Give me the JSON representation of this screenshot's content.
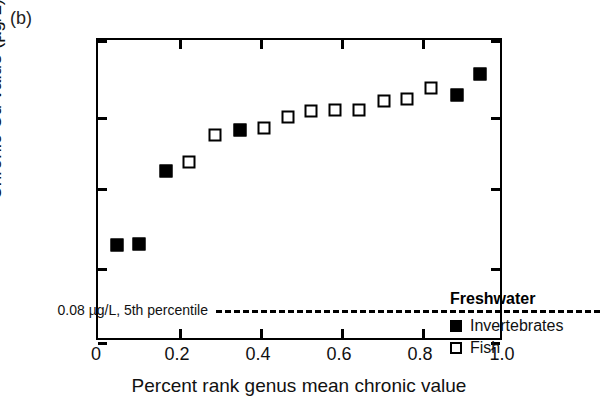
{
  "panel": {
    "label": "(b)"
  },
  "axes": {
    "y_title": "Chronic Cd value (µg/L)",
    "x_title": "Percent rank genus mean chronic value",
    "y_ticks": [
      {
        "label": "100",
        "px": 0
      },
      {
        "label": "10",
        "px": 77
      },
      {
        "label": "1",
        "px": 148
      },
      {
        "label": "−1",
        "px": 228
      },
      {
        "label": "−10",
        "px": 302
      }
    ],
    "x_ticks": [
      {
        "label": "0",
        "px": 0
      },
      {
        "label": "0.2",
        "px": 81
      },
      {
        "label": "0.4",
        "px": 162
      },
      {
        "label": "0.6",
        "px": 243
      },
      {
        "label": "0.8",
        "px": 324
      },
      {
        "label": "1.0",
        "px": 406
      }
    ]
  },
  "threshold": {
    "label": "0.08 µg/L, 5th percentile",
    "value": 0.08
  },
  "legend": {
    "title": "Freshwater",
    "items": [
      {
        "label": "Invertebrates",
        "marker": "filled-square"
      },
      {
        "label": "Fish",
        "marker": "open-square"
      }
    ]
  },
  "chart_data": {
    "type": "scatter",
    "title": "(b)",
    "xlabel": "Percent rank genus mean chronic value",
    "ylabel": "Chronic Cd value (µg/L)",
    "xlim": [
      0,
      1.0
    ],
    "ylim": [
      -10,
      100
    ],
    "yscale": "signed-log (broken axis: 100, 10, 1, -1, -10)",
    "grid": false,
    "legend_position": "inside-lower-right",
    "annotations": [
      {
        "type": "hline",
        "y": 0.08,
        "text": "0.08 µg/L, 5th percentile",
        "style": "dashed"
      }
    ],
    "series": [
      {
        "name": "Invertebrates",
        "marker": "filled-square",
        "points": [
          {
            "x": 0.05,
            "y": 0.6,
            "px": 19,
            "py": 205
          },
          {
            "x": 0.105,
            "y": 0.62,
            "px": 41,
            "py": 204
          },
          {
            "x": 0.17,
            "y": 1.8,
            "px": 68,
            "py": 131
          },
          {
            "x": 0.35,
            "y": 5.2,
            "px": 142,
            "py": 90
          },
          {
            "x": 0.88,
            "y": 21.0,
            "px": 359,
            "py": 55
          },
          {
            "x": 0.955,
            "y": 36.0,
            "px": 382,
            "py": 34
          }
        ]
      },
      {
        "name": "Fish",
        "marker": "open-square",
        "points": [
          {
            "x": 0.225,
            "y": 2.3,
            "px": 91,
            "py": 122
          },
          {
            "x": 0.29,
            "y": 4.7,
            "px": 117,
            "py": 95
          },
          {
            "x": 0.41,
            "y": 5.5,
            "px": 166,
            "py": 88
          },
          {
            "x": 0.47,
            "y": 7.4,
            "px": 190,
            "py": 77
          },
          {
            "x": 0.525,
            "y": 8.6,
            "px": 213,
            "py": 71
          },
          {
            "x": 0.585,
            "y": 8.8,
            "px": 237,
            "py": 70
          },
          {
            "x": 0.645,
            "y": 8.8,
            "px": 261,
            "py": 70
          },
          {
            "x": 0.705,
            "y": 11.5,
            "px": 286,
            "py": 61
          },
          {
            "x": 0.76,
            "y": 12.5,
            "px": 309,
            "py": 59
          },
          {
            "x": 0.82,
            "y": 19.5,
            "px": 333,
            "py": 48
          }
        ]
      }
    ]
  }
}
